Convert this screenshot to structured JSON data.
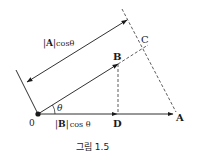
{
  "diagram": {
    "points": {
      "origin": "0",
      "A": "A",
      "B": "B",
      "C": "C",
      "D": "D"
    },
    "angle_label": "θ",
    "labels": {
      "A_projection": {
        "bar_open": "|",
        "vec": "A",
        "bar_close": "|",
        "func": "cosθ"
      },
      "B_projection": {
        "bar_open": "|",
        "vec": "B",
        "bar_close": "|",
        "func": "cos θ"
      }
    },
    "caption": "그림 1.5",
    "colors": {
      "line": "#1a1a1a",
      "dashed": "#333333",
      "background": "#ffffff"
    }
  }
}
